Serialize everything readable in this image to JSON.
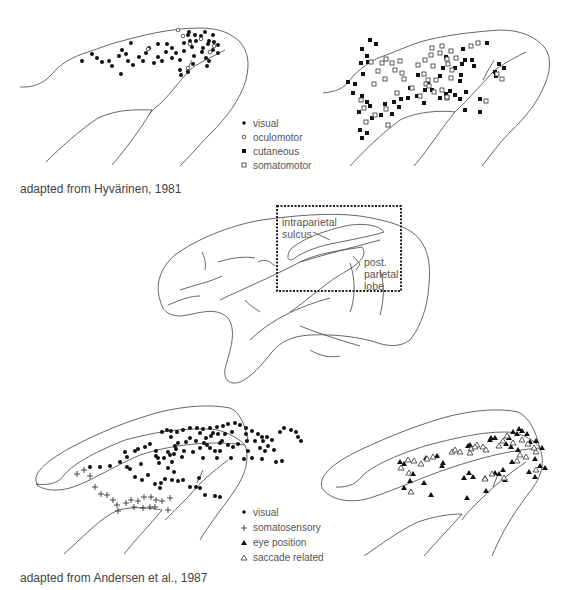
{
  "figure": {
    "top": {
      "caption": "adapted from Hyvärinen, 1981",
      "legend": [
        {
          "symbol": "filled-circle",
          "label": "visual"
        },
        {
          "symbol": "open-circle",
          "label": "oculomotor"
        },
        {
          "symbol": "filled-square",
          "label": "cutaneous"
        },
        {
          "symbol": "open-square",
          "label": "somatomotor"
        }
      ]
    },
    "middle": {
      "labels": {
        "sulcus": [
          "intraparietal",
          "sulcus"
        ],
        "lobe": [
          "post.",
          "parietal",
          "lobe"
        ]
      }
    },
    "bottom": {
      "caption": "adapted from Andersen et al., 1987",
      "legend": [
        {
          "symbol": "filled-circle",
          "label": "visual"
        },
        {
          "symbol": "cross",
          "label": "somatosensory"
        },
        {
          "symbol": "filled-triangle",
          "label": "eye position"
        },
        {
          "symbol": "open-triangle",
          "label": "saccade related"
        }
      ]
    }
  },
  "markers": {
    "top_left_filled_circles": [
      [
        82,
        61
      ],
      [
        92,
        54
      ],
      [
        97,
        58
      ],
      [
        102,
        62
      ],
      [
        109,
        61
      ],
      [
        112,
        66
      ],
      [
        119,
        56
      ],
      [
        122,
        50
      ],
      [
        126,
        54
      ],
      [
        128,
        61
      ],
      [
        131,
        43
      ],
      [
        133,
        65
      ],
      [
        139,
        57
      ],
      [
        143,
        61
      ],
      [
        146,
        53
      ],
      [
        149,
        48
      ],
      [
        154,
        63
      ],
      [
        158,
        44
      ],
      [
        158,
        57
      ],
      [
        162,
        61
      ],
      [
        166,
        52
      ],
      [
        167,
        44
      ],
      [
        172,
        48
      ],
      [
        172,
        58
      ],
      [
        176,
        53
      ],
      [
        180,
        60
      ],
      [
        184,
        43
      ],
      [
        184,
        51
      ],
      [
        188,
        35
      ],
      [
        190,
        41
      ],
      [
        192,
        47
      ],
      [
        194,
        56
      ],
      [
        195,
        35
      ],
      [
        196,
        41
      ],
      [
        201,
        36
      ],
      [
        203,
        48
      ],
      [
        205,
        32
      ],
      [
        208,
        44
      ],
      [
        207,
        66
      ],
      [
        209,
        41
      ],
      [
        213,
        35
      ],
      [
        214,
        42
      ],
      [
        218,
        45
      ],
      [
        121,
        74
      ],
      [
        180,
        70
      ],
      [
        181,
        75
      ],
      [
        188,
        72
      ],
      [
        189,
        32
      ],
      [
        193,
        64
      ],
      [
        202,
        52
      ],
      [
        206,
        58
      ],
      [
        209,
        61
      ],
      [
        213,
        50
      ],
      [
        218,
        53
      ]
    ],
    "top_left_open_circles": [
      [
        178,
        30
      ],
      [
        183,
        36
      ],
      [
        190,
        44
      ],
      [
        148,
        49
      ],
      [
        201,
        39
      ],
      [
        210,
        52
      ],
      [
        214,
        46
      ],
      [
        188,
        68
      ]
    ],
    "top_right_filled_squares": [
      [
        362,
        49
      ],
      [
        370,
        40
      ],
      [
        376,
        44
      ],
      [
        367,
        56
      ],
      [
        361,
        63
      ],
      [
        368,
        62
      ],
      [
        363,
        74
      ],
      [
        355,
        84
      ],
      [
        348,
        82
      ],
      [
        353,
        93
      ],
      [
        362,
        96
      ],
      [
        367,
        102
      ],
      [
        359,
        112
      ],
      [
        370,
        106
      ],
      [
        372,
        118
      ],
      [
        360,
        130
      ],
      [
        362,
        138
      ],
      [
        367,
        133
      ],
      [
        381,
        115
      ],
      [
        392,
        114
      ],
      [
        385,
        104
      ],
      [
        394,
        102
      ],
      [
        399,
        107
      ],
      [
        401,
        99
      ],
      [
        408,
        98
      ],
      [
        417,
        96
      ],
      [
        425,
        90
      ],
      [
        424,
        103
      ],
      [
        432,
        90
      ],
      [
        440,
        98
      ],
      [
        446,
        94
      ],
      [
        450,
        91
      ],
      [
        455,
        95
      ],
      [
        460,
        99
      ],
      [
        410,
        88
      ],
      [
        418,
        75
      ],
      [
        428,
        84
      ],
      [
        440,
        76
      ],
      [
        443,
        68
      ],
      [
        446,
        57
      ],
      [
        455,
        68
      ],
      [
        462,
        64
      ],
      [
        461,
        75
      ],
      [
        465,
        60
      ],
      [
        466,
        92
      ],
      [
        463,
        49
      ],
      [
        472,
        60
      ],
      [
        480,
        99
      ],
      [
        474,
        66
      ],
      [
        487,
        43
      ],
      [
        499,
        64
      ],
      [
        495,
        72
      ],
      [
        460,
        81
      ],
      [
        465,
        110
      ],
      [
        480,
        112
      ],
      [
        504,
        68
      ],
      [
        496,
        76
      ]
    ],
    "top_right_open_squares": [
      [
        374,
        84
      ],
      [
        385,
        79
      ],
      [
        371,
        62
      ],
      [
        378,
        71
      ],
      [
        382,
        63
      ],
      [
        386,
        59
      ],
      [
        392,
        63
      ],
      [
        395,
        70
      ],
      [
        400,
        61
      ],
      [
        402,
        73
      ],
      [
        404,
        79
      ],
      [
        397,
        93
      ],
      [
        412,
        88
      ],
      [
        420,
        96
      ],
      [
        424,
        74
      ],
      [
        428,
        80
      ],
      [
        436,
        80
      ],
      [
        434,
        92
      ],
      [
        442,
        90
      ],
      [
        447,
        98
      ],
      [
        451,
        78
      ],
      [
        448,
        64
      ],
      [
        452,
        70
      ],
      [
        447,
        59
      ],
      [
        440,
        53
      ],
      [
        431,
        55
      ],
      [
        433,
        66
      ],
      [
        425,
        60
      ],
      [
        418,
        65
      ],
      [
        426,
        84
      ],
      [
        429,
        86
      ],
      [
        442,
        46
      ],
      [
        432,
        48
      ],
      [
        451,
        51
      ],
      [
        456,
        58
      ],
      [
        471,
        46
      ],
      [
        478,
        43
      ],
      [
        486,
        101
      ],
      [
        497,
        74
      ],
      [
        502,
        79
      ],
      [
        447,
        97
      ],
      [
        364,
        108
      ],
      [
        366,
        122
      ],
      [
        375,
        115
      ],
      [
        386,
        109
      ],
      [
        388,
        125
      ],
      [
        361,
        100
      ]
    ],
    "bottom_left_filled_circles": [
      [
        90,
        467
      ],
      [
        100,
        467
      ],
      [
        110,
        466
      ],
      [
        120,
        462
      ],
      [
        125,
        452
      ],
      [
        127,
        457
      ],
      [
        135,
        451
      ],
      [
        138,
        449
      ],
      [
        145,
        447
      ],
      [
        150,
        444
      ],
      [
        156,
        451
      ],
      [
        156,
        456
      ],
      [
        158,
        458
      ],
      [
        159,
        463
      ],
      [
        164,
        458
      ],
      [
        168,
        452
      ],
      [
        171,
        437
      ],
      [
        174,
        454
      ],
      [
        176,
        449
      ],
      [
        170,
        455
      ],
      [
        172,
        462
      ],
      [
        175,
        446
      ],
      [
        178,
        443
      ],
      [
        182,
        457
      ],
      [
        184,
        451
      ],
      [
        186,
        442
      ],
      [
        190,
        438
      ],
      [
        193,
        452
      ],
      [
        196,
        441
      ],
      [
        200,
        433
      ],
      [
        206,
        438
      ],
      [
        211,
        436
      ],
      [
        213,
        433
      ],
      [
        218,
        434
      ],
      [
        220,
        443
      ],
      [
        222,
        441
      ],
      [
        225,
        434
      ],
      [
        228,
        445
      ],
      [
        232,
        432
      ],
      [
        233,
        447
      ],
      [
        238,
        444
      ],
      [
        246,
        434
      ],
      [
        247,
        441
      ],
      [
        248,
        451
      ],
      [
        255,
        441
      ],
      [
        260,
        448
      ],
      [
        263,
        441
      ],
      [
        268,
        446
      ],
      [
        274,
        450
      ],
      [
        162,
        432
      ],
      [
        167,
        430
      ],
      [
        171,
        431
      ],
      [
        177,
        432
      ],
      [
        183,
        430
      ],
      [
        190,
        428
      ],
      [
        197,
        428
      ],
      [
        203,
        429
      ],
      [
        210,
        428
      ],
      [
        217,
        427
      ],
      [
        223,
        426
      ],
      [
        228,
        424
      ],
      [
        235,
        423
      ],
      [
        240,
        425
      ],
      [
        246,
        428
      ],
      [
        252,
        431
      ],
      [
        258,
        434
      ],
      [
        262,
        437
      ],
      [
        267,
        437
      ],
      [
        272,
        440
      ],
      [
        280,
        432
      ],
      [
        284,
        428
      ],
      [
        291,
        430
      ],
      [
        296,
        432
      ],
      [
        298,
        437
      ],
      [
        301,
        441
      ],
      [
        204,
        443
      ],
      [
        210,
        448
      ],
      [
        215,
        451
      ],
      [
        220,
        451
      ],
      [
        130,
        469
      ],
      [
        135,
        477
      ],
      [
        142,
        480
      ],
      [
        148,
        475
      ],
      [
        155,
        484
      ],
      [
        160,
        488
      ],
      [
        165,
        479
      ],
      [
        172,
        480
      ],
      [
        178,
        481
      ],
      [
        183,
        480
      ],
      [
        190,
        487
      ],
      [
        196,
        487
      ],
      [
        200,
        488
      ],
      [
        205,
        495
      ],
      [
        215,
        496
      ],
      [
        220,
        497
      ],
      [
        174,
        472
      ],
      [
        168,
        468
      ],
      [
        161,
        483
      ],
      [
        127,
        467
      ],
      [
        141,
        464
      ],
      [
        199,
        478
      ],
      [
        203,
        458
      ],
      [
        217,
        458
      ],
      [
        231,
        458
      ],
      [
        244,
        459
      ],
      [
        252,
        458
      ],
      [
        262,
        459
      ],
      [
        265,
        451
      ],
      [
        276,
        462
      ],
      [
        282,
        461
      ],
      [
        200,
        448
      ],
      [
        207,
        445
      ]
    ],
    "bottom_left_crosses": [
      [
        77,
        474
      ],
      [
        84,
        470
      ],
      [
        90,
        476
      ],
      [
        95,
        487
      ],
      [
        101,
        494
      ],
      [
        107,
        495
      ],
      [
        113,
        500
      ],
      [
        117,
        505
      ],
      [
        126,
        503
      ],
      [
        131,
        500
      ],
      [
        138,
        501
      ],
      [
        144,
        497
      ],
      [
        151,
        497
      ],
      [
        156,
        500
      ],
      [
        162,
        501
      ],
      [
        170,
        498
      ],
      [
        168,
        510
      ],
      [
        134,
        507
      ],
      [
        143,
        508
      ],
      [
        150,
        507
      ],
      [
        155,
        507
      ],
      [
        118,
        511
      ]
    ],
    "bottom_right_filled_triangles": [
      [
        400,
        462
      ],
      [
        404,
        464
      ],
      [
        426,
        458
      ],
      [
        437,
        456
      ],
      [
        442,
        466
      ],
      [
        443,
        463
      ],
      [
        468,
        446
      ],
      [
        470,
        445
      ],
      [
        490,
        440
      ],
      [
        491,
        438
      ],
      [
        495,
        438
      ],
      [
        509,
        438
      ],
      [
        513,
        432
      ],
      [
        517,
        434
      ],
      [
        519,
        429
      ],
      [
        522,
        431
      ],
      [
        527,
        434
      ],
      [
        506,
        444
      ],
      [
        511,
        447
      ],
      [
        518,
        450
      ],
      [
        530,
        442
      ],
      [
        536,
        441
      ],
      [
        542,
        448
      ],
      [
        535,
        459
      ],
      [
        540,
        466
      ],
      [
        545,
        468
      ],
      [
        535,
        477
      ],
      [
        529,
        472
      ],
      [
        512,
        462
      ],
      [
        503,
        470
      ],
      [
        495,
        473
      ],
      [
        505,
        480
      ],
      [
        499,
        474
      ],
      [
        485,
        478
      ],
      [
        473,
        477
      ],
      [
        469,
        473
      ],
      [
        464,
        478
      ],
      [
        486,
        491
      ],
      [
        467,
        498
      ],
      [
        424,
        483
      ],
      [
        410,
        481
      ],
      [
        413,
        474
      ],
      [
        431,
        495
      ],
      [
        404,
        488
      ]
    ],
    "bottom_right_open_triangles": [
      [
        408,
        460
      ],
      [
        414,
        461
      ],
      [
        421,
        464
      ],
      [
        427,
        459
      ],
      [
        433,
        457
      ],
      [
        452,
        452
      ],
      [
        455,
        450
      ],
      [
        460,
        452
      ],
      [
        471,
        449
      ],
      [
        477,
        445
      ],
      [
        483,
        447
      ],
      [
        486,
        450
      ],
      [
        499,
        446
      ],
      [
        503,
        441
      ],
      [
        507,
        436
      ],
      [
        513,
        443
      ],
      [
        522,
        440
      ],
      [
        528,
        444
      ],
      [
        536,
        452
      ],
      [
        534,
        448
      ],
      [
        520,
        455
      ],
      [
        517,
        461
      ],
      [
        526,
        457
      ],
      [
        536,
        470
      ],
      [
        409,
        473
      ],
      [
        411,
        492
      ],
      [
        485,
        479
      ],
      [
        492,
        474
      ],
      [
        504,
        478
      ],
      [
        475,
        447
      ],
      [
        470,
        453
      ],
      [
        401,
        468
      ]
    ]
  }
}
